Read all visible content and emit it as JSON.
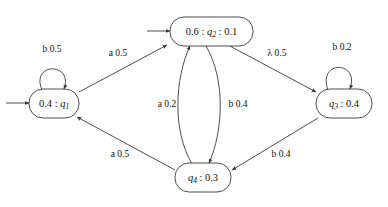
{
  "diagram": {
    "type": "state-transition-diagram",
    "colors": {
      "stroke": "#3a3a3a",
      "text": "#101010",
      "background": "#ffffff"
    },
    "states": [
      {
        "id": "q1",
        "name": "q1",
        "label_prefix": "0.4 : ",
        "label_state": "q",
        "label_subscript": "1",
        "label_suffix": "",
        "full_label": "0.4 : q1",
        "initial_weight": "0.4",
        "final_weight": "",
        "initial": true,
        "x": 55,
        "y": 103
      },
      {
        "id": "q2",
        "name": "q2",
        "label_prefix": "0.6 : ",
        "label_state": "q",
        "label_subscript": "2",
        "label_suffix": " : 0.1",
        "full_label": "0.6 : q2 : 0.1",
        "initial_weight": "0.6",
        "final_weight": "0.1",
        "initial": true,
        "x": 196,
        "y": 31
      },
      {
        "id": "q3",
        "name": "q3",
        "label_prefix": "",
        "label_state": "q",
        "label_subscript": "3",
        "label_suffix": " : 0.4",
        "full_label": "q3 : 0.4",
        "initial_weight": "",
        "final_weight": "0.4",
        "initial": false,
        "x": 338,
        "y": 103
      },
      {
        "id": "q4",
        "name": "q4",
        "label_prefix": "",
        "label_state": "q",
        "label_subscript": "4",
        "label_suffix": " : 0.3",
        "full_label": "q4 : 0.3",
        "initial_weight": "",
        "final_weight": "0.3",
        "initial": false,
        "x": 204,
        "y": 178
      }
    ],
    "transitions": [
      {
        "id": "t-q1-q1",
        "from": "q1",
        "to": "q1",
        "symbol": "b",
        "weight": "0.5",
        "label": "b 0.5",
        "kind": "self-loop",
        "label_x": 52,
        "label_y": 50
      },
      {
        "id": "t-q1-q2",
        "from": "q1",
        "to": "q2",
        "symbol": "a",
        "weight": "0.5",
        "label": "a 0.5",
        "kind": "straight",
        "label_x": 118,
        "label_y": 54
      },
      {
        "id": "t-q2-q3",
        "from": "q2",
        "to": "q3",
        "symbol": "λ",
        "weight": "0.5",
        "label": "λ 0.5",
        "kind": "straight",
        "label_x": 277,
        "label_y": 54
      },
      {
        "id": "t-q3-q3",
        "from": "q3",
        "to": "q3",
        "symbol": "b",
        "weight": "0.2",
        "label": "b 0.2",
        "kind": "self-loop",
        "label_x": 342,
        "label_y": 48
      },
      {
        "id": "t-q4-q2",
        "from": "q4",
        "to": "q2",
        "symbol": "a",
        "weight": "0.2",
        "label": "a 0.2",
        "kind": "curve-left",
        "label_x": 167,
        "label_y": 105
      },
      {
        "id": "t-q2-q4",
        "from": "q2",
        "to": "q4",
        "symbol": "b",
        "weight": "0.4",
        "label": "b 0.4",
        "kind": "curve-right",
        "label_x": 238,
        "label_y": 105
      },
      {
        "id": "t-q4-q1",
        "from": "q4",
        "to": "q1",
        "symbol": "a",
        "weight": "0.5",
        "label": "a 0.5",
        "kind": "straight",
        "label_x": 120,
        "label_y": 155
      },
      {
        "id": "t-q3-q4",
        "from": "q3",
        "to": "q4",
        "symbol": "b",
        "weight": "0.4",
        "label": "b 0.4",
        "kind": "straight",
        "label_x": 281,
        "label_y": 155
      }
    ],
    "start_arrows": [
      {
        "id": "start-q1",
        "target": "q1",
        "x1": 6,
        "y1": 103,
        "x2": 30,
        "y2": 103
      },
      {
        "id": "start-q2",
        "target": "q2",
        "x1": 147,
        "y1": 31,
        "x2": 171,
        "y2": 31
      }
    ]
  }
}
